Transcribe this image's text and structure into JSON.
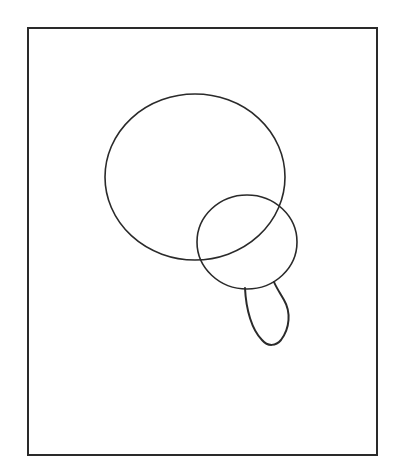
{
  "canvas": {
    "width": 399,
    "height": 473,
    "background": "#ffffff"
  },
  "stroke": {
    "color": "#2a2a2a",
    "width": 1.6
  },
  "frame": {
    "x": 28,
    "y": 28,
    "width": 349,
    "height": 427,
    "stroke_width": 2
  },
  "shapes": {
    "large_circle": {
      "cx": 195,
      "cy": 177,
      "rx": 90,
      "ry": 83
    },
    "small_circle": {
      "cx": 247,
      "cy": 242,
      "rx": 50,
      "ry": 47
    },
    "tail": {
      "d": "M245,288 C246,310 252,330 262,340 C268,347 276,346 281,340 C290,328 291,312 284,300 C280,293 276,287 274,282"
    }
  }
}
